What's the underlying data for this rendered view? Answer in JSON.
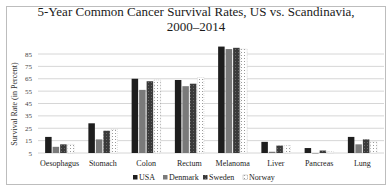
{
  "chart_data": {
    "type": "bar",
    "title": "5-Year Common Cancer Survival Rates, US vs. Scandinavia,",
    "subtitle": "2000–2014",
    "xlabel": "",
    "ylabel": "Survival Rate (in Percent)",
    "ylim": [
      5,
      95
    ],
    "yticks": [
      5,
      15,
      25,
      35,
      45,
      55,
      65,
      75,
      85
    ],
    "grid": true,
    "legend_position": "bottom",
    "categories": [
      "Oesophagus",
      "Stomach",
      "Colon",
      "Rectum",
      "Melanoma",
      "Liver",
      "Pancreas",
      "Lung"
    ],
    "series": [
      {
        "name": "USA",
        "color": "#1e1e1e",
        "pattern": "solid",
        "values": [
          18,
          29,
          65,
          64,
          91,
          14,
          9,
          18
        ]
      },
      {
        "name": "Denmark",
        "color": "#7a7a7a",
        "pattern": "solid",
        "values": [
          10,
          16,
          56,
          59,
          89,
          6,
          5,
          12
        ]
      },
      {
        "name": "Sweden",
        "color": "#3a3a3a",
        "pattern": "dotted-dark",
        "values": [
          12,
          23,
          63,
          61,
          90,
          11,
          7,
          16
        ]
      },
      {
        "name": "Norway",
        "color": "#ffffff",
        "pattern": "dotted-light",
        "values": [
          12,
          24,
          64,
          66,
          89,
          11,
          6,
          14
        ]
      }
    ]
  }
}
